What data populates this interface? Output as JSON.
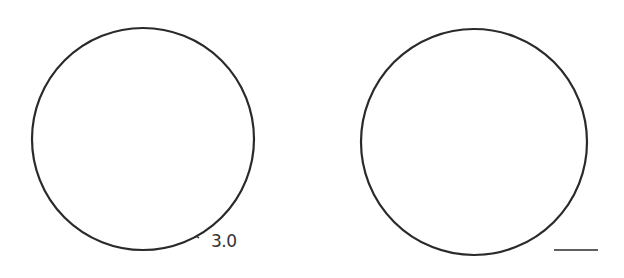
{
  "diagram": {
    "left_circle": {
      "cx": 143,
      "cy": 139,
      "r": 111,
      "stroke": "#2a2a2a",
      "label": "3.0"
    },
    "right_circle": {
      "cx": 474,
      "cy": 142,
      "r": 113,
      "stroke": "#2a2a2a"
    },
    "scale_bar": {
      "x1": 554,
      "x2": 598,
      "y": 250,
      "stroke": "#2a2a2a"
    }
  }
}
